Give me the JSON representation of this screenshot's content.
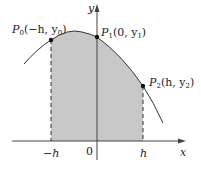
{
  "figure": {
    "axes": {
      "x_label": "x",
      "y_label": "y",
      "ticks": {
        "neg_h": "−h",
        "zero": "0",
        "pos_h": "h"
      }
    },
    "points": [
      {
        "name": "P",
        "sub": "0",
        "coords_open": "(−h, y",
        "coords_sub": "0",
        "coords_close": ")"
      },
      {
        "name": "P",
        "sub": "1",
        "coords_open": "(0, y",
        "coords_sub": "1",
        "coords_close": ")"
      },
      {
        "name": "P",
        "sub": "2",
        "coords_open": "(h, y",
        "coords_sub": "2",
        "coords_close": ")"
      }
    ],
    "colors": {
      "shade": "#c8c8c8",
      "line": "#333333",
      "axis": "#444444"
    }
  }
}
